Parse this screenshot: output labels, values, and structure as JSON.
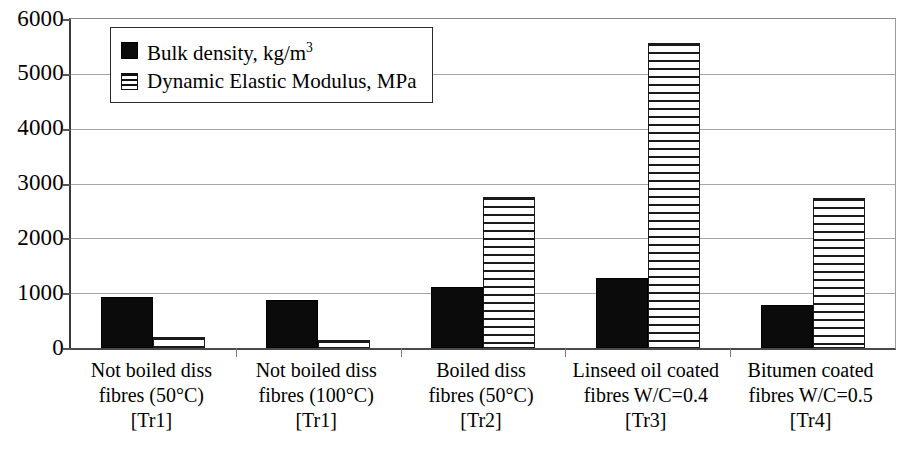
{
  "chart_data": {
    "type": "bar",
    "title": "",
    "xlabel": "",
    "ylabel": "",
    "ylim": [
      0,
      6000
    ],
    "ytick_step": 1000,
    "yticks": [
      "6000",
      "5000",
      "4000",
      "3000",
      "2000",
      "1000",
      "0"
    ],
    "grid": true,
    "legend_position": "top-left-inside",
    "categories": [
      "Not boiled diss fibres (50°C) [Tr1]",
      "Not boiled diss fibres (100°C) [Tr1]",
      "Boiled diss fibres (50°C) [Tr2]",
      "Linseed oil coated fibres W/C=0.4 [Tr3]",
      "Bitumen coated fibres W/C=0.5 [Tr4]"
    ],
    "category_lines": [
      [
        "Not boiled diss",
        "fibres (50°C)",
        "[Tr1]"
      ],
      [
        "Not boiled diss",
        "fibres (100°C)",
        "[Tr1]"
      ],
      [
        "Boiled diss",
        "fibres (50°C)",
        "[Tr2]"
      ],
      [
        "Linseed oil coated",
        "fibres W/C=0.4",
        "[Tr3]"
      ],
      [
        "Bitumen coated",
        "fibres W/C=0.5",
        "[Tr4]"
      ]
    ],
    "series": [
      {
        "name": "Bulk density, kg/m3",
        "label_main": "Bulk density, kg/m",
        "label_sup": "3",
        "pattern": "solid-black",
        "color": "#0b0b0b",
        "values": [
          930,
          880,
          1120,
          1280,
          790
        ]
      },
      {
        "name": "Dynamic Elastic Modulus, MPa",
        "label_main": "Dynamic Elastic Modulus, MPa",
        "label_sup": "",
        "pattern": "horizontal-stripes",
        "color": "#ffffff",
        "values": [
          200,
          150,
          2760,
          5570,
          2740
        ]
      }
    ]
  },
  "caption": ""
}
